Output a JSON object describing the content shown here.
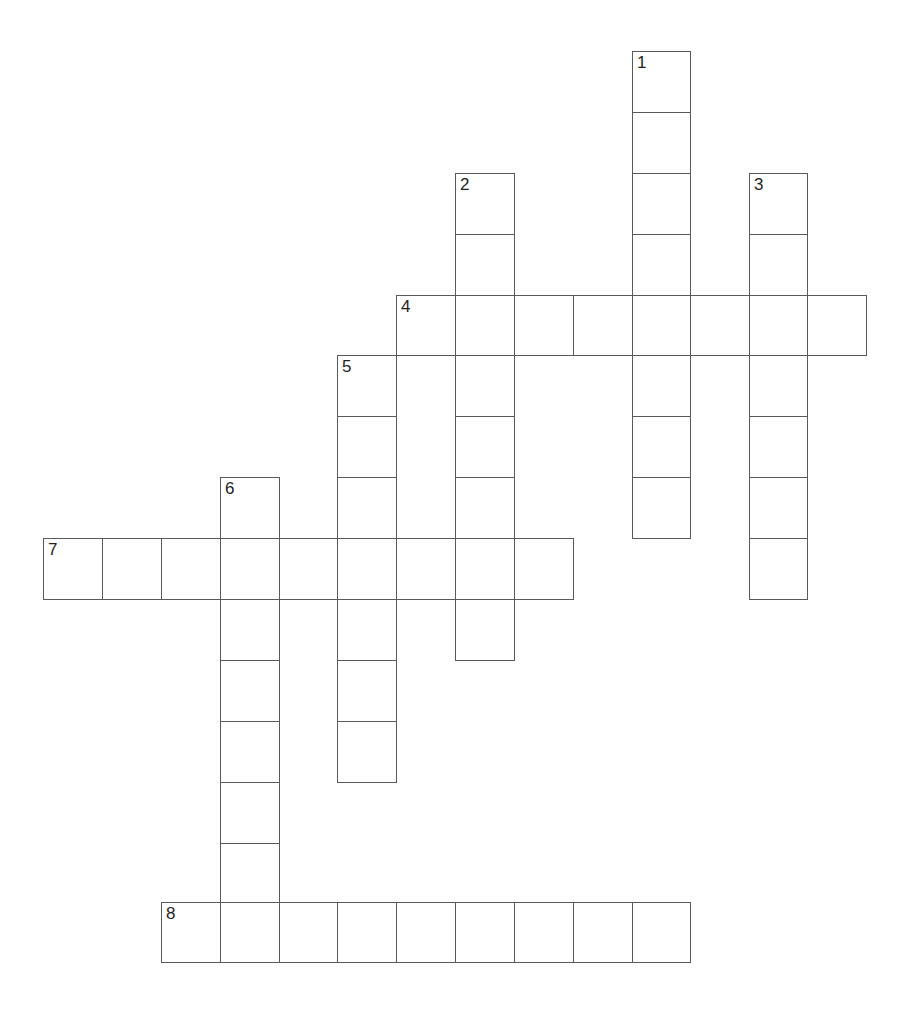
{
  "puzzle": {
    "type": "crossword-grid",
    "title": "",
    "width_px": 909,
    "height_px": 1010,
    "cell_size_px": 59,
    "background_color": "#ffffff",
    "grid_line_color": "#58595b",
    "number_color": "#231f20",
    "origin": {
      "x": 43,
      "y": 51
    },
    "column_x": [
      43,
      102,
      161,
      220,
      279,
      337,
      396,
      455,
      514,
      573,
      632,
      690,
      749,
      807,
      866
    ],
    "row_y": [
      51,
      112,
      173,
      234,
      295,
      355,
      416,
      477,
      538,
      599,
      660,
      721,
      782,
      843,
      902,
      962
    ],
    "clue_numbers": [
      "1",
      "2",
      "3",
      "4",
      "5",
      "6",
      "7",
      "8"
    ],
    "entries": [
      {
        "number": "1",
        "direction": "down",
        "col": 10,
        "row": 0,
        "length": 8
      },
      {
        "number": "2",
        "direction": "down",
        "col": 7,
        "row": 2,
        "length": 8
      },
      {
        "number": "3",
        "direction": "down",
        "col": 12,
        "row": 2,
        "length": 7
      },
      {
        "number": "4",
        "direction": "across",
        "col": 6,
        "row": 4,
        "length": 8
      },
      {
        "number": "5",
        "direction": "down",
        "col": 5,
        "row": 5,
        "length": 7
      },
      {
        "number": "6",
        "direction": "down",
        "col": 3,
        "row": 7,
        "length": 8
      },
      {
        "number": "7",
        "direction": "across",
        "col": 0,
        "row": 8,
        "length": 9
      },
      {
        "number": "8",
        "direction": "across",
        "col": 2,
        "row": 14,
        "length": 9
      }
    ],
    "cells": [
      {
        "col": 10,
        "row": 0,
        "number": "1",
        "letter": ""
      },
      {
        "col": 10,
        "row": 1,
        "number": "",
        "letter": ""
      },
      {
        "col": 10,
        "row": 2,
        "number": "",
        "letter": ""
      },
      {
        "col": 10,
        "row": 3,
        "number": "",
        "letter": ""
      },
      {
        "col": 10,
        "row": 4,
        "number": "",
        "letter": ""
      },
      {
        "col": 10,
        "row": 5,
        "number": "",
        "letter": ""
      },
      {
        "col": 10,
        "row": 6,
        "number": "",
        "letter": ""
      },
      {
        "col": 10,
        "row": 7,
        "number": "",
        "letter": ""
      },
      {
        "col": 7,
        "row": 2,
        "number": "2",
        "letter": ""
      },
      {
        "col": 7,
        "row": 3,
        "number": "",
        "letter": ""
      },
      {
        "col": 7,
        "row": 4,
        "number": "",
        "letter": ""
      },
      {
        "col": 7,
        "row": 5,
        "number": "",
        "letter": ""
      },
      {
        "col": 7,
        "row": 6,
        "number": "",
        "letter": ""
      },
      {
        "col": 7,
        "row": 7,
        "number": "",
        "letter": ""
      },
      {
        "col": 7,
        "row": 8,
        "number": "",
        "letter": ""
      },
      {
        "col": 7,
        "row": 9,
        "number": "",
        "letter": ""
      },
      {
        "col": 12,
        "row": 2,
        "number": "3",
        "letter": ""
      },
      {
        "col": 12,
        "row": 3,
        "number": "",
        "letter": ""
      },
      {
        "col": 12,
        "row": 4,
        "number": "",
        "letter": ""
      },
      {
        "col": 12,
        "row": 5,
        "number": "",
        "letter": ""
      },
      {
        "col": 12,
        "row": 6,
        "number": "",
        "letter": ""
      },
      {
        "col": 12,
        "row": 7,
        "number": "",
        "letter": ""
      },
      {
        "col": 12,
        "row": 8,
        "number": "",
        "letter": ""
      },
      {
        "col": 6,
        "row": 4,
        "number": "4",
        "letter": ""
      },
      {
        "col": 8,
        "row": 4,
        "number": "",
        "letter": ""
      },
      {
        "col": 9,
        "row": 4,
        "number": "",
        "letter": ""
      },
      {
        "col": 11,
        "row": 4,
        "number": "",
        "letter": ""
      },
      {
        "col": 13,
        "row": 4,
        "number": "",
        "letter": ""
      },
      {
        "col": 5,
        "row": 5,
        "number": "5",
        "letter": ""
      },
      {
        "col": 5,
        "row": 6,
        "number": "",
        "letter": ""
      },
      {
        "col": 5,
        "row": 7,
        "number": "",
        "letter": ""
      },
      {
        "col": 5,
        "row": 8,
        "number": "",
        "letter": ""
      },
      {
        "col": 5,
        "row": 9,
        "number": "",
        "letter": ""
      },
      {
        "col": 5,
        "row": 10,
        "number": "",
        "letter": ""
      },
      {
        "col": 5,
        "row": 11,
        "number": "",
        "letter": ""
      },
      {
        "col": 3,
        "row": 7,
        "number": "6",
        "letter": ""
      },
      {
        "col": 3,
        "row": 8,
        "number": "",
        "letter": ""
      },
      {
        "col": 3,
        "row": 9,
        "number": "",
        "letter": ""
      },
      {
        "col": 3,
        "row": 10,
        "number": "",
        "letter": ""
      },
      {
        "col": 3,
        "row": 11,
        "number": "",
        "letter": ""
      },
      {
        "col": 3,
        "row": 12,
        "number": "",
        "letter": ""
      },
      {
        "col": 3,
        "row": 13,
        "number": "",
        "letter": ""
      },
      {
        "col": 0,
        "row": 8,
        "number": "7",
        "letter": ""
      },
      {
        "col": 1,
        "row": 8,
        "number": "",
        "letter": ""
      },
      {
        "col": 2,
        "row": 8,
        "number": "",
        "letter": ""
      },
      {
        "col": 4,
        "row": 8,
        "number": "",
        "letter": ""
      },
      {
        "col": 6,
        "row": 8,
        "number": "",
        "letter": ""
      },
      {
        "col": 8,
        "row": 8,
        "number": "",
        "letter": ""
      },
      {
        "col": 2,
        "row": 14,
        "number": "8",
        "letter": ""
      },
      {
        "col": 4,
        "row": 14,
        "number": "",
        "letter": ""
      },
      {
        "col": 5,
        "row": 14,
        "number": "",
        "letter": ""
      },
      {
        "col": 6,
        "row": 14,
        "number": "",
        "letter": ""
      },
      {
        "col": 7,
        "row": 14,
        "number": "",
        "letter": ""
      },
      {
        "col": 8,
        "row": 14,
        "number": "",
        "letter": ""
      },
      {
        "col": 9,
        "row": 14,
        "number": "",
        "letter": ""
      },
      {
        "col": 10,
        "row": 14,
        "number": "",
        "letter": ""
      },
      {
        "col": 3,
        "row": 14,
        "number": "",
        "letter": ""
      }
    ]
  }
}
